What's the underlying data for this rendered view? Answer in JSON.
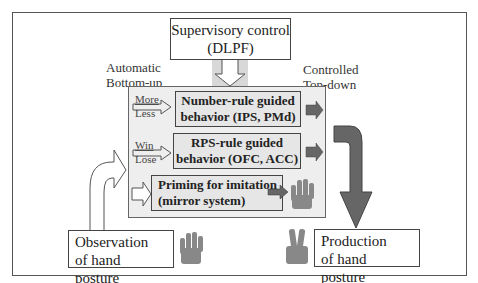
{
  "supervisory": {
    "line1": "Supervisory control",
    "line2": "(DLPF)"
  },
  "left_label": {
    "line1": "Automatic",
    "line2": "Bottom-up"
  },
  "right_label": {
    "line1": "Controlled",
    "line2": "Top-down"
  },
  "rules": [
    {
      "line1": "Number-rule guided",
      "line2": "behavior (IPS, PMd)",
      "input_top": "More",
      "input_bottom": "Less"
    },
    {
      "line1": "RPS-rule guided",
      "line2": "behavior (OFC, ACC)",
      "input_top": "Win",
      "input_bottom": "Lose"
    },
    {
      "line1": "Priming for imitation",
      "line2": "(mirror system)"
    }
  ],
  "observation": {
    "line1": "Observation",
    "line2": "of hand posture"
  },
  "production": {
    "line1": "Production",
    "line2": "of hand posture"
  },
  "colors": {
    "arrow_dark": "#666666",
    "box_fill": "#e6e6e6",
    "panel_fill": "#eeeeee",
    "hand": "#888888"
  }
}
